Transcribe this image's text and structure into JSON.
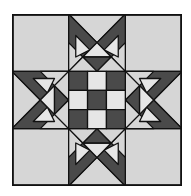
{
  "image": {
    "subject": "quilt-block-pattern",
    "grid": "3x3 block with 8-point star arms and nine-patch center"
  },
  "colors": {
    "background": "#ffffff",
    "outline": "#111111",
    "light": "#d6d6d6",
    "lighter": "#e6e6e6",
    "medium": "#9a9a9a",
    "dark": "#4a4a4a"
  },
  "block": {
    "corners": [
      "light",
      "light",
      "light",
      "light"
    ],
    "center_ninepatch": [
      [
        "dark",
        "lighter",
        "dark"
      ],
      [
        "lighter",
        "dark",
        "lighter"
      ],
      [
        "dark",
        "lighter",
        "dark"
      ]
    ],
    "arms": [
      "top",
      "right",
      "bottom",
      "left"
    ]
  }
}
